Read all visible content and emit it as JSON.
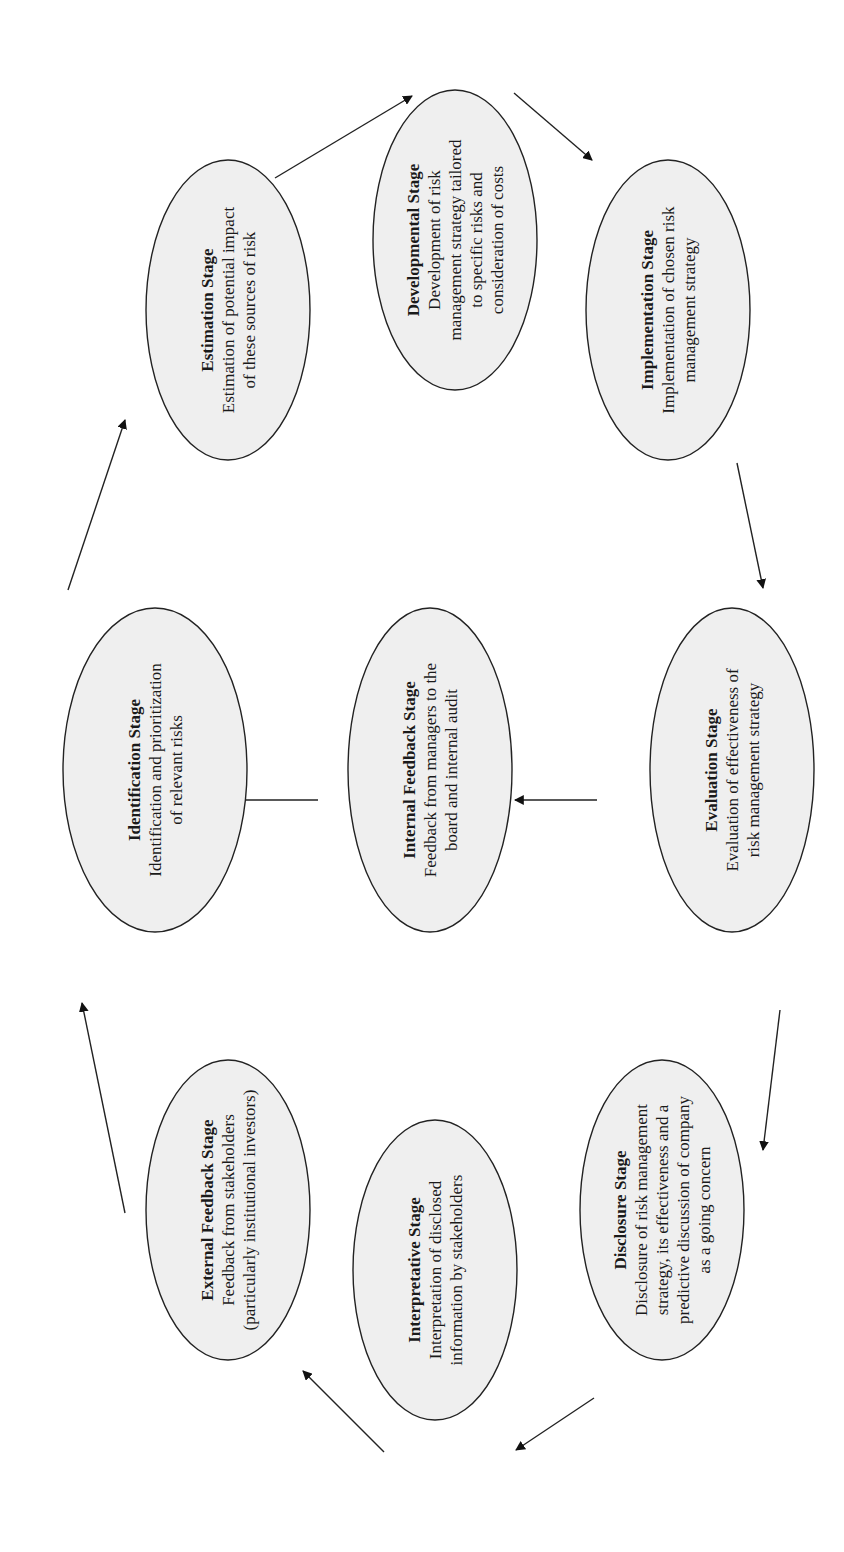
{
  "diagram": {
    "orientation": "rotated-90-ccw",
    "colors": {
      "ellipse_fill": "#efefef",
      "stroke": "#222222",
      "background": "#ffffff"
    },
    "nodes": [
      {
        "id": "estimation",
        "title": "Estimation Stage",
        "lines": [
          "Estimation of potential impact",
          "of these sources of risk"
        ],
        "cx": 228,
        "cy": 310,
        "rx": 82,
        "ry": 150
      },
      {
        "id": "developmental",
        "title": "Developmental Stage",
        "lines": [
          "Development of risk",
          "management strategy tailored",
          "to specific risks and",
          "consideration of costs"
        ],
        "cx": 455,
        "cy": 240,
        "rx": 82,
        "ry": 150
      },
      {
        "id": "implementation",
        "title": "Implementation Stage",
        "lines": [
          "Implementation of chosen risk",
          "management strategy"
        ],
        "cx": 668,
        "cy": 310,
        "rx": 82,
        "ry": 150
      },
      {
        "id": "identification",
        "title": "Identification Stage",
        "lines": [
          "Identification and prioritization",
          "of relevant risks"
        ],
        "cx": 155,
        "cy": 770,
        "rx": 92,
        "ry": 162
      },
      {
        "id": "internal-feedback",
        "title": "Internal Feedback Stage",
        "lines": [
          "Feedback from managers to the",
          "board and internal audit"
        ],
        "cx": 430,
        "cy": 770,
        "rx": 82,
        "ry": 162
      },
      {
        "id": "evaluation",
        "title": "Evaluation Stage",
        "lines": [
          "Evaluation of effectiveness of",
          "risk management strategy"
        ],
        "cx": 732,
        "cy": 770,
        "rx": 82,
        "ry": 162
      },
      {
        "id": "external-feedback",
        "title": "External Feedback Stage",
        "lines": [
          "Feedback from stakeholders",
          "(particularly institutional investors)"
        ],
        "cx": 228,
        "cy": 1210,
        "rx": 82,
        "ry": 150
      },
      {
        "id": "interpretative",
        "title": "Interpretative Stage",
        "lines": [
          "Interpretation of disclosed",
          "information by stakeholders"
        ],
        "cx": 435,
        "cy": 1270,
        "rx": 82,
        "ry": 150
      },
      {
        "id": "disclosure",
        "title": "Disclosure Stage",
        "lines": [
          "Disclosure of risk management",
          "strategy, its effectiveness and a",
          "predictive discussion of company",
          "as a going concern"
        ],
        "cx": 662,
        "cy": 1210,
        "rx": 82,
        "ry": 150
      }
    ],
    "arrows": [
      {
        "from": "identification",
        "to": "estimation",
        "x1": 68,
        "y1": 590,
        "x2": 125,
        "y2": 420
      },
      {
        "from": "estimation",
        "to": "developmental",
        "x1": 275,
        "y1": 178,
        "x2": 412,
        "y2": 96
      },
      {
        "from": "developmental",
        "to": "implementation",
        "x1": 514,
        "y1": 93,
        "x2": 592,
        "y2": 160
      },
      {
        "from": "implementation",
        "to": "evaluation",
        "x1": 737,
        "y1": 463,
        "x2": 763,
        "y2": 588
      },
      {
        "from": "evaluation",
        "to": "internal-feedback",
        "x1": 597,
        "y1": 800,
        "x2": 515,
        "y2": 800
      },
      {
        "from": "internal-feedback",
        "to": "identification",
        "x1": 318,
        "y1": 800,
        "x2": 235,
        "y2": 800
      },
      {
        "from": "evaluation",
        "to": "disclosure",
        "x1": 780,
        "y1": 1010,
        "x2": 763,
        "y2": 1150
      },
      {
        "from": "disclosure",
        "to": "interpretative",
        "x1": 594,
        "y1": 1398,
        "x2": 516,
        "y2": 1450
      },
      {
        "from": "interpretative",
        "to": "external-feedback",
        "x1": 384,
        "y1": 1452,
        "x2": 303,
        "y2": 1371
      },
      {
        "from": "external-feedback",
        "to": "identification",
        "x1": 125,
        "y1": 1213,
        "x2": 82,
        "y2": 1003
      }
    ]
  }
}
